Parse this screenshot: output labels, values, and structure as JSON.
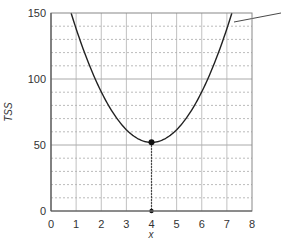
{
  "chart_data": {
    "type": "line",
    "title": "",
    "xlabel": "x",
    "ylabel": "TSS",
    "xlim": [
      0,
      8
    ],
    "ylim": [
      0,
      150
    ],
    "x_ticks": [
      0,
      1,
      2,
      3,
      4,
      5,
      6,
      7,
      8
    ],
    "y_ticks": [
      0,
      50,
      100,
      150
    ],
    "grid": {
      "major_y": [
        50,
        100
      ],
      "minor_y_step": 10,
      "vertical_x_step": 1,
      "minor_style": "dashed"
    },
    "series": [
      {
        "name": "TSS curve",
        "description": "parabola with minimum at x=4",
        "x": [
          0.8,
          1,
          2,
          3,
          4,
          5,
          6,
          7,
          7.2
        ],
        "values": [
          150,
          139,
          90,
          62,
          52,
          62,
          90,
          139,
          150
        ]
      }
    ],
    "annotations": [
      {
        "type": "point",
        "x": 4,
        "y": 52,
        "label": "minimum"
      },
      {
        "type": "point",
        "x": 4,
        "y": 0
      },
      {
        "type": "dotted-vertical-line",
        "x": 4,
        "from": 0,
        "to": 52
      },
      {
        "type": "leader-line",
        "from_x": 7.3,
        "from_y": 145,
        "note": "callout line pointing off-chart to upper right"
      }
    ]
  },
  "labels": {
    "xlabel": "x",
    "ylabel": "TSS",
    "xticks": [
      "0",
      "1",
      "2",
      "3",
      "4",
      "5",
      "6",
      "7",
      "8"
    ],
    "yticks": [
      "0",
      "50",
      "100",
      "150"
    ]
  }
}
